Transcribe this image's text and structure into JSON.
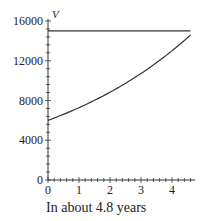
{
  "chart_data": {
    "type": "line",
    "title": "",
    "xlabel": "",
    "ylabel": "V",
    "xlim": [
      0,
      4.8
    ],
    "ylim": [
      0,
      16000
    ],
    "x_ticks": [
      "0",
      "1",
      "2",
      "3",
      "4"
    ],
    "y_ticks": [
      "0",
      "4000",
      "8000",
      "12000",
      "16000"
    ],
    "grid": false,
    "series": [
      {
        "name": "V(t) growth curve",
        "x": [
          0,
          1,
          2,
          3,
          4,
          4.6
        ],
        "values": [
          6000,
          7200,
          8650,
          10400,
          12500,
          14600
        ]
      },
      {
        "name": "V = 15000",
        "x": [
          0,
          4.6
        ],
        "values": [
          15000,
          15000
        ]
      }
    ]
  },
  "caption": "In about 4.8 years"
}
